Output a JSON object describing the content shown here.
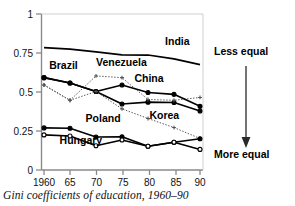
{
  "chart_data": {
    "type": "line",
    "title": "",
    "caption": "Gini coefficients of education, 1960–90",
    "xlabel": "",
    "ylabel": "",
    "x": [
      1960,
      1965,
      1970,
      1975,
      1980,
      1985,
      1990
    ],
    "xtick_labels": [
      "1960",
      "65",
      "70",
      "75",
      "80",
      "85",
      "90"
    ],
    "ytick_labels": [
      "0",
      "0.25",
      "0.5",
      "0.75",
      "1"
    ],
    "ytick_values": [
      0,
      0.25,
      0.5,
      0.75,
      1
    ],
    "xlim": [
      1960,
      1990
    ],
    "ylim": [
      0,
      1
    ],
    "grid": false,
    "legend_position": "inline-labels",
    "series": [
      {
        "name": "India",
        "values": [
          0.785,
          0.775,
          0.757,
          0.738,
          0.737,
          0.712,
          0.675
        ],
        "style": "solid",
        "marker": "none",
        "color": "#000000",
        "label_x": 1988,
        "label_y": 0.8
      },
      {
        "name": "Brazil",
        "values": [
          0.592,
          0.558,
          0.503,
          0.423,
          0.435,
          0.433,
          0.378
        ],
        "style": "solid",
        "marker": "filled-circle",
        "color": "#000000",
        "label_x": 1961,
        "label_y": 0.645
      },
      {
        "name": "Venezuela",
        "values": [
          0.545,
          0.447,
          0.603,
          0.592,
          0.452,
          0.447,
          0.465
        ],
        "style": "dotted",
        "marker": "cross",
        "color": "#555555",
        "label_x": 1970,
        "label_y": 0.665
      },
      {
        "name": "China",
        "values": [
          0.592,
          0.558,
          0.503,
          0.545,
          0.497,
          0.485,
          0.408
        ],
        "style": "solid",
        "marker": "filled-circle",
        "color": "#000000",
        "label_x": 1983,
        "label_y": 0.565
      },
      {
        "name": "Korea",
        "values": [
          0.545,
          0.447,
          0.503,
          0.392,
          0.33,
          0.272,
          0.202
        ],
        "style": "dotted",
        "marker": "cross",
        "color": "#555555",
        "label_x": 1986,
        "label_y": 0.325
      },
      {
        "name": "Poland",
        "values": [
          0.27,
          0.268,
          0.212,
          0.213,
          0.152,
          0.178,
          0.2
        ],
        "style": "solid",
        "marker": "filled-circle",
        "color": "#000000",
        "label_x": 1968,
        "label_y": 0.308
      },
      {
        "name": "Hungary",
        "values": [
          0.225,
          0.218,
          0.155,
          0.192,
          0.152,
          0.178,
          0.132
        ],
        "style": "solid",
        "marker": "open-circle",
        "color": "#000000",
        "label_x": 1963,
        "label_y": 0.168
      }
    ],
    "annotations": [
      {
        "name": "less-equal",
        "text": "Less equal",
        "position": "top-right"
      },
      {
        "name": "more-equal",
        "text": "More equal",
        "position": "bottom-right"
      },
      {
        "name": "direction-arrow",
        "text": "",
        "position": "right",
        "icon": "down-arrow-icon"
      }
    ]
  }
}
